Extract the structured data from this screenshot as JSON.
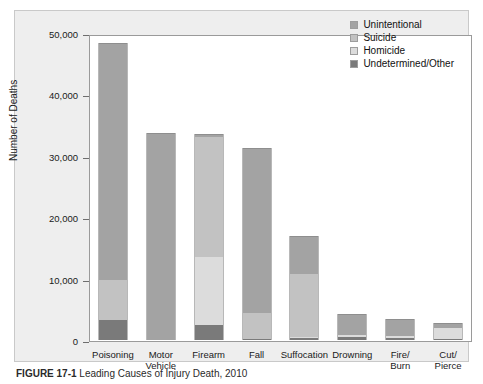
{
  "figure": {
    "caption_label": "FIGURE 17-1",
    "caption_text": "Leading Causes of Injury Death, 2010"
  },
  "colors": {
    "unintentional": "#a3a3a3",
    "suicide": "#c2c2c2",
    "homicide": "#dcdcdc",
    "undetermined": "#7a7a7a",
    "panel_bg": "#eeeeee",
    "plot_bg": "#ffffff",
    "axis": "#6e6e6e"
  },
  "chart_data": {
    "type": "bar",
    "subtype": "stacked-vertical",
    "title": "",
    "xlabel": "",
    "ylabel": "Number of Deaths",
    "ylim": [
      0,
      50000
    ],
    "yticks": [
      0,
      10000,
      20000,
      30000,
      40000,
      50000
    ],
    "ytick_labels": [
      "0",
      "10,000",
      "20,000",
      "30,000",
      "40,000",
      "50,000"
    ],
    "grid": false,
    "legend_position": "top-right",
    "categories": [
      "Poisoning",
      "Motor\nVehicle",
      "Firearm",
      "Fall",
      "Suffocation",
      "Drowning",
      "Fire/\nBurn",
      "Cut/\nPierce"
    ],
    "series": [
      {
        "name": "Unintentional",
        "values": [
          38700,
          33700,
          600,
          26900,
          6200,
          3500,
          2800,
          800
        ]
      },
      {
        "name": "Suicide",
        "values": [
          6400,
          0,
          19400,
          4300,
          10300,
          0,
          0,
          0
        ]
      },
      {
        "name": "Homicide",
        "values": [
          0,
          0,
          11100,
          0,
          200,
          300,
          400,
          1700
        ]
      },
      {
        "name": "Undetermined/Other",
        "values": [
          3300,
          0,
          2500,
          100,
          300,
          500,
          300,
          200
        ]
      }
    ],
    "totals": [
      48400,
      33700,
      33600,
      31300,
      17000,
      4300,
      3500,
      2700
    ],
    "legend_entries": [
      "Unintentional",
      "Suicide",
      "Homicide",
      "Undetermined/Other"
    ]
  }
}
